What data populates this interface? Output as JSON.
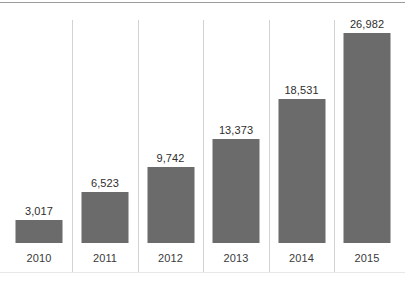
{
  "chart_data": {
    "type": "bar",
    "title": "",
    "subtitle": "",
    "xlabel": "",
    "ylabel": "",
    "grid": false,
    "legend": false,
    "orientation": "vertical",
    "bar_color": "#6b6b6b",
    "separator_color": "#d2d2d2",
    "label_color": "#2e2e2e",
    "background": "#ffffff",
    "baseline_value": 0,
    "ylim": [
      0,
      26982
    ],
    "categories": [
      "2010",
      "2011",
      "2012",
      "2013",
      "2014",
      "2015"
    ],
    "values": [
      3017,
      6523,
      9742,
      13373,
      18531,
      26982
    ],
    "value_labels": [
      "3,017",
      "6,523",
      "9,742",
      "13,373",
      "18,531",
      "26,982"
    ],
    "tick_labels": [
      "2010",
      "2011",
      "2012",
      "2013",
      "2014",
      "2015"
    ]
  }
}
